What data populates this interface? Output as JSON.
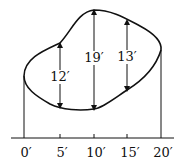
{
  "diagram": {
    "x_axis": {
      "ticks": [
        "0′",
        "5′",
        "10′",
        "15′",
        "20′"
      ]
    },
    "measurements": [
      {
        "x": "5′",
        "label": "12′"
      },
      {
        "x": "10′",
        "label": "19′"
      },
      {
        "x": "15′",
        "label": "13′"
      }
    ]
  }
}
